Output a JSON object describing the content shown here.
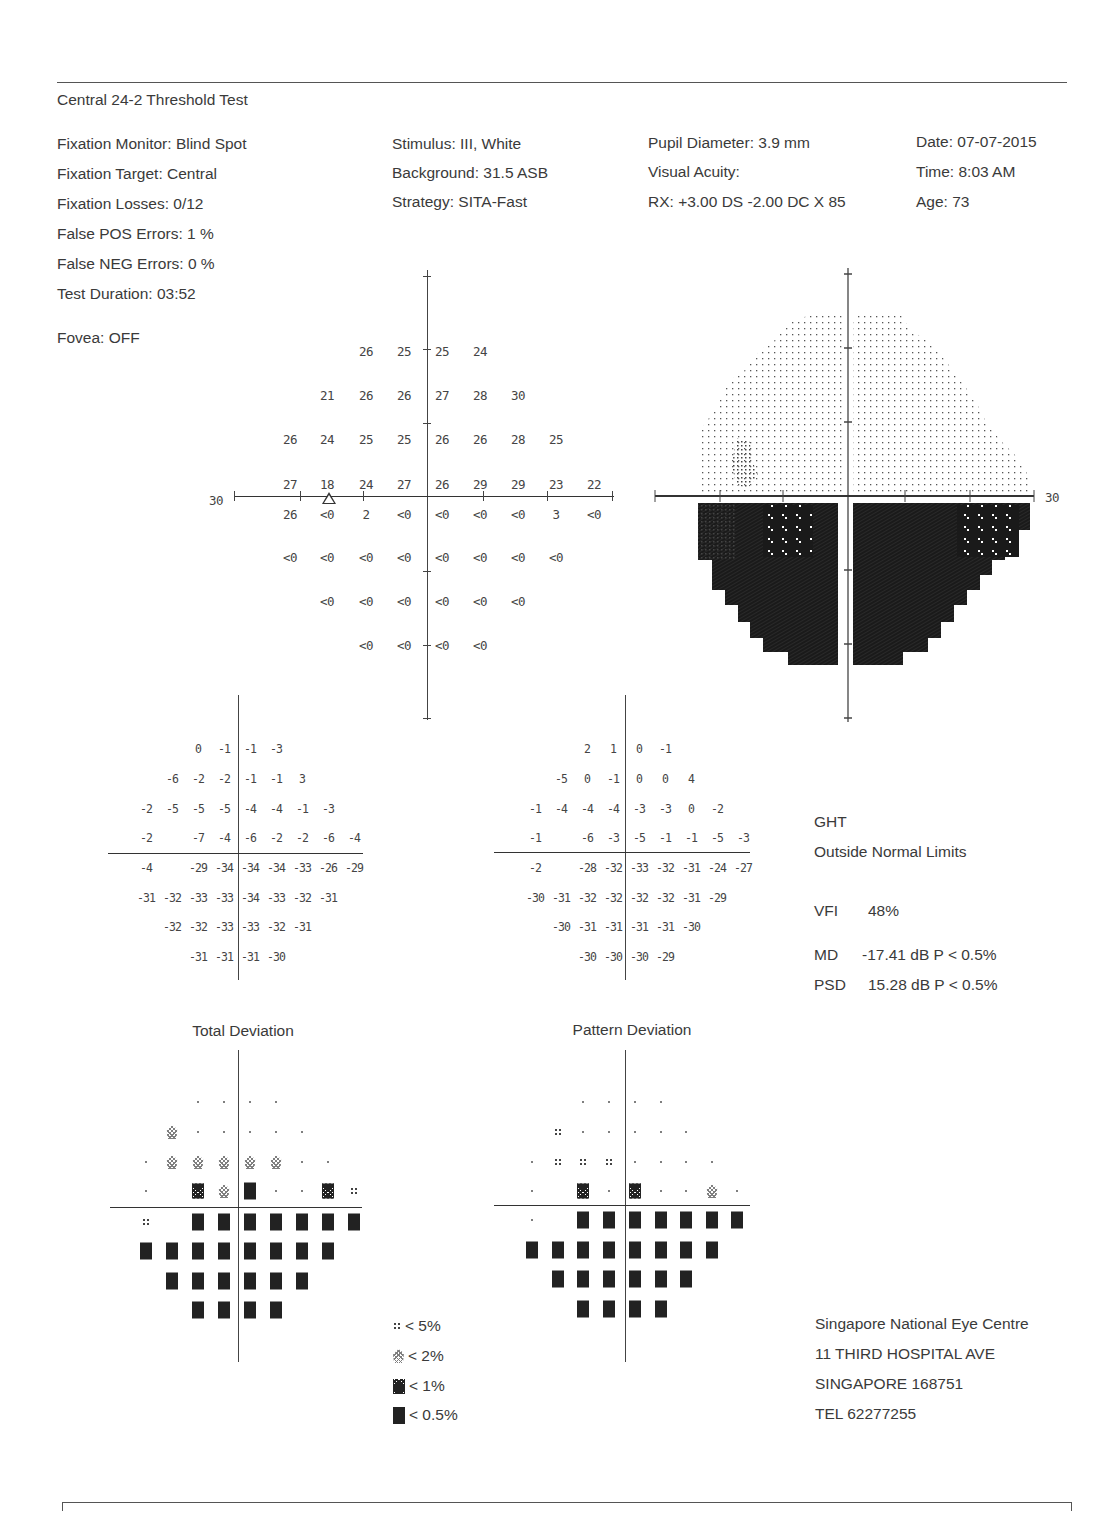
{
  "header": {
    "test_name": "Central 24-2 Threshold Test"
  },
  "info": {
    "col1": [
      "Fixation Monitor: Blind Spot",
      "Fixation Target: Central",
      "Fixation Losses: 0/12",
      "False POS Errors:  1 %",
      "False NEG Errors:  0 %",
      "Test Duration: 03:52"
    ],
    "fovea": "Fovea: OFF",
    "col2": [
      "Stimulus: III, White",
      "Background: 31.5 ASB",
      "Strategy: SITA-Fast"
    ],
    "col3": [
      "Pupil Diameter: 3.9 mm",
      "Visual Acuity:",
      "RX: +3.00 DS  -2.00 DC  X  85"
    ],
    "col4": [
      "Date: 07-07-2015",
      "Time:  8:03 AM",
      "Age: 73"
    ]
  },
  "threshold_plot": {
    "axis_label": "30",
    "rows": [
      {
        "y": 351,
        "cells": [
          [
            366,
            "26"
          ],
          [
            404,
            "25"
          ],
          [
            442,
            "25"
          ],
          [
            480,
            "24"
          ]
        ]
      },
      {
        "y": 395,
        "cells": [
          [
            327,
            "21"
          ],
          [
            366,
            "26"
          ],
          [
            404,
            "26"
          ],
          [
            442,
            "27"
          ],
          [
            480,
            "28"
          ],
          [
            518,
            "30"
          ]
        ]
      },
      {
        "y": 439,
        "cells": [
          [
            290,
            "26"
          ],
          [
            327,
            "24"
          ],
          [
            366,
            "25"
          ],
          [
            404,
            "25"
          ],
          [
            442,
            "26"
          ],
          [
            480,
            "26"
          ],
          [
            518,
            "28"
          ],
          [
            556,
            "25"
          ]
        ]
      },
      {
        "y": 484,
        "cells": [
          [
            290,
            "27"
          ],
          [
            327,
            "18"
          ],
          [
            366,
            "24"
          ],
          [
            404,
            "27"
          ],
          [
            442,
            "26"
          ],
          [
            480,
            "29"
          ],
          [
            518,
            "29"
          ],
          [
            556,
            "23"
          ],
          [
            594,
            "22"
          ]
        ]
      },
      {
        "y": 514,
        "cells": [
          [
            290,
            "26"
          ],
          [
            327,
            "<0"
          ],
          [
            366,
            "2"
          ],
          [
            404,
            "<0"
          ],
          [
            442,
            "<0"
          ],
          [
            480,
            "<0"
          ],
          [
            518,
            "<0"
          ],
          [
            556,
            "3"
          ],
          [
            594,
            "<0"
          ]
        ]
      },
      {
        "y": 557,
        "cells": [
          [
            290,
            "<0"
          ],
          [
            327,
            "<0"
          ],
          [
            366,
            "<0"
          ],
          [
            404,
            "<0"
          ],
          [
            442,
            "<0"
          ],
          [
            480,
            "<0"
          ],
          [
            518,
            "<0"
          ],
          [
            556,
            "<0"
          ]
        ]
      },
      {
        "y": 601,
        "cells": [
          [
            327,
            "<0"
          ],
          [
            366,
            "<0"
          ],
          [
            404,
            "<0"
          ],
          [
            442,
            "<0"
          ],
          [
            480,
            "<0"
          ],
          [
            518,
            "<0"
          ]
        ]
      },
      {
        "y": 645,
        "cells": [
          [
            366,
            "<0"
          ],
          [
            404,
            "<0"
          ],
          [
            442,
            "<0"
          ],
          [
            480,
            "<0"
          ]
        ]
      }
    ]
  },
  "grayscale_plot": {
    "axis_label": "30"
  },
  "total_deviation": {
    "title": "Total Deviation",
    "rows": [
      {
        "y": 749,
        "cells": [
          [
            198,
            "0"
          ],
          [
            224,
            "-1"
          ],
          [
            250,
            "-1"
          ],
          [
            276,
            "-3"
          ]
        ]
      },
      {
        "y": 779,
        "cells": [
          [
            172,
            "-6"
          ],
          [
            198,
            "-2"
          ],
          [
            224,
            "-2"
          ],
          [
            250,
            "-1"
          ],
          [
            276,
            "-1"
          ],
          [
            302,
            "3"
          ]
        ]
      },
      {
        "y": 809,
        "cells": [
          [
            146,
            "-2"
          ],
          [
            172,
            "-5"
          ],
          [
            198,
            "-5"
          ],
          [
            224,
            "-5"
          ],
          [
            250,
            "-4"
          ],
          [
            276,
            "-4"
          ],
          [
            302,
            "-1"
          ],
          [
            328,
            "-3"
          ]
        ]
      },
      {
        "y": 838,
        "cells": [
          [
            146,
            "-2"
          ],
          [
            198,
            "-7"
          ],
          [
            224,
            "-4"
          ],
          [
            250,
            "-6"
          ],
          [
            276,
            "-2"
          ],
          [
            302,
            "-2"
          ],
          [
            328,
            "-6"
          ],
          [
            354,
            "-4"
          ]
        ]
      },
      {
        "y": 868,
        "cells": [
          [
            146,
            "-4"
          ],
          [
            198,
            "-29"
          ],
          [
            224,
            "-34"
          ],
          [
            250,
            "-34"
          ],
          [
            276,
            "-34"
          ],
          [
            302,
            "-33"
          ],
          [
            328,
            "-26"
          ],
          [
            354,
            "-29"
          ]
        ]
      },
      {
        "y": 898,
        "cells": [
          [
            146,
            "-31"
          ],
          [
            172,
            "-32"
          ],
          [
            198,
            "-33"
          ],
          [
            224,
            "-33"
          ],
          [
            250,
            "-34"
          ],
          [
            276,
            "-33"
          ],
          [
            302,
            "-32"
          ],
          [
            328,
            "-31"
          ]
        ]
      },
      {
        "y": 927,
        "cells": [
          [
            172,
            "-32"
          ],
          [
            198,
            "-32"
          ],
          [
            224,
            "-33"
          ],
          [
            250,
            "-33"
          ],
          [
            276,
            "-32"
          ],
          [
            302,
            "-31"
          ]
        ]
      },
      {
        "y": 957,
        "cells": [
          [
            198,
            "-31"
          ],
          [
            224,
            "-31"
          ],
          [
            250,
            "-31"
          ],
          [
            276,
            "-30"
          ]
        ]
      }
    ]
  },
  "pattern_deviation": {
    "title": "Pattern Deviation",
    "rows": [
      {
        "y": 749,
        "cells": [
          [
            587,
            "2"
          ],
          [
            613,
            "1"
          ],
          [
            639,
            "0"
          ],
          [
            665,
            "-1"
          ]
        ]
      },
      {
        "y": 779,
        "cells": [
          [
            561,
            "-5"
          ],
          [
            587,
            "0"
          ],
          [
            613,
            "-1"
          ],
          [
            639,
            "0"
          ],
          [
            665,
            "0"
          ],
          [
            691,
            "4"
          ]
        ]
      },
      {
        "y": 809,
        "cells": [
          [
            535,
            "-1"
          ],
          [
            561,
            "-4"
          ],
          [
            587,
            "-4"
          ],
          [
            613,
            "-4"
          ],
          [
            639,
            "-3"
          ],
          [
            665,
            "-3"
          ],
          [
            691,
            "0"
          ],
          [
            717,
            "-2"
          ]
        ]
      },
      {
        "y": 838,
        "cells": [
          [
            535,
            "-1"
          ],
          [
            587,
            "-6"
          ],
          [
            613,
            "-3"
          ],
          [
            639,
            "-5"
          ],
          [
            665,
            "-1"
          ],
          [
            691,
            "-1"
          ],
          [
            717,
            "-5"
          ],
          [
            743,
            "-3"
          ]
        ]
      },
      {
        "y": 868,
        "cells": [
          [
            535,
            "-2"
          ],
          [
            587,
            "-28"
          ],
          [
            613,
            "-32"
          ],
          [
            639,
            "-33"
          ],
          [
            665,
            "-32"
          ],
          [
            691,
            "-31"
          ],
          [
            717,
            "-24"
          ],
          [
            743,
            "-27"
          ]
        ]
      },
      {
        "y": 898,
        "cells": [
          [
            535,
            "-30"
          ],
          [
            561,
            "-31"
          ],
          [
            587,
            "-32"
          ],
          [
            613,
            "-32"
          ],
          [
            639,
            "-32"
          ],
          [
            665,
            "-32"
          ],
          [
            691,
            "-31"
          ],
          [
            717,
            "-29"
          ]
        ]
      },
      {
        "y": 927,
        "cells": [
          [
            561,
            "-30"
          ],
          [
            587,
            "-31"
          ],
          [
            613,
            "-31"
          ],
          [
            639,
            "-31"
          ],
          [
            665,
            "-31"
          ],
          [
            691,
            "-30"
          ]
        ]
      },
      {
        "y": 957,
        "cells": [
          [
            587,
            "-30"
          ],
          [
            613,
            "-30"
          ],
          [
            639,
            "-30"
          ],
          [
            665,
            "-29"
          ]
        ]
      }
    ]
  },
  "total_deviation_prob": {
    "rows": [
      {
        "y": 1102,
        "cells": [
          [
            198,
            "dot"
          ],
          [
            224,
            "dot"
          ],
          [
            250,
            "dot"
          ],
          [
            276,
            "dot"
          ]
        ]
      },
      {
        "y": 1132,
        "cells": [
          [
            172,
            "p2"
          ],
          [
            198,
            "dot"
          ],
          [
            224,
            "dot"
          ],
          [
            250,
            "dot"
          ],
          [
            276,
            "dot"
          ],
          [
            302,
            "dot"
          ]
        ]
      },
      {
        "y": 1162,
        "cells": [
          [
            146,
            "dot"
          ],
          [
            172,
            "p2"
          ],
          [
            198,
            "p2"
          ],
          [
            224,
            "p2"
          ],
          [
            250,
            "p2"
          ],
          [
            276,
            "p2"
          ],
          [
            302,
            "dot"
          ],
          [
            328,
            "dot"
          ]
        ]
      },
      {
        "y": 1191,
        "cells": [
          [
            146,
            "dot"
          ],
          [
            198,
            "p1"
          ],
          [
            224,
            "p2"
          ],
          [
            250,
            "p05"
          ],
          [
            276,
            "dot"
          ],
          [
            302,
            "dot"
          ],
          [
            328,
            "p1"
          ],
          [
            354,
            "p5"
          ]
        ]
      },
      {
        "y": 1222,
        "cells": [
          [
            146,
            "p5"
          ],
          [
            198,
            "p05"
          ],
          [
            224,
            "p05"
          ],
          [
            250,
            "p05"
          ],
          [
            276,
            "p05"
          ],
          [
            302,
            "p05"
          ],
          [
            328,
            "p05"
          ],
          [
            354,
            "p05"
          ]
        ]
      },
      {
        "y": 1251,
        "cells": [
          [
            146,
            "p05"
          ],
          [
            172,
            "p05"
          ],
          [
            198,
            "p05"
          ],
          [
            224,
            "p05"
          ],
          [
            250,
            "p05"
          ],
          [
            276,
            "p05"
          ],
          [
            302,
            "p05"
          ],
          [
            328,
            "p05"
          ]
        ]
      },
      {
        "y": 1281,
        "cells": [
          [
            172,
            "p05"
          ],
          [
            198,
            "p05"
          ],
          [
            224,
            "p05"
          ],
          [
            250,
            "p05"
          ],
          [
            276,
            "p05"
          ],
          [
            302,
            "p05"
          ]
        ]
      },
      {
        "y": 1310,
        "cells": [
          [
            198,
            "p05"
          ],
          [
            224,
            "p05"
          ],
          [
            250,
            "p05"
          ],
          [
            276,
            "p05"
          ]
        ]
      }
    ]
  },
  "pattern_deviation_prob": {
    "rows": [
      {
        "y": 1102,
        "cells": [
          [
            583,
            "dot"
          ],
          [
            609,
            "dot"
          ],
          [
            635,
            "dot"
          ],
          [
            661,
            "dot"
          ]
        ]
      },
      {
        "y": 1132,
        "cells": [
          [
            558,
            "p5"
          ],
          [
            583,
            "dot"
          ],
          [
            609,
            "dot"
          ],
          [
            635,
            "dot"
          ],
          [
            661,
            "dot"
          ],
          [
            686,
            "dot"
          ]
        ]
      },
      {
        "y": 1162,
        "cells": [
          [
            532,
            "dot"
          ],
          [
            558,
            "p5"
          ],
          [
            583,
            "p5"
          ],
          [
            609,
            "p5"
          ],
          [
            635,
            "dot"
          ],
          [
            661,
            "dot"
          ],
          [
            686,
            "dot"
          ],
          [
            712,
            "dot"
          ]
        ]
      },
      {
        "y": 1191,
        "cells": [
          [
            532,
            "dot"
          ],
          [
            583,
            "p1"
          ],
          [
            609,
            "dot"
          ],
          [
            635,
            "p1"
          ],
          [
            661,
            "dot"
          ],
          [
            686,
            "dot"
          ],
          [
            712,
            "p2"
          ],
          [
            737,
            "dot"
          ]
        ]
      },
      {
        "y": 1220,
        "cells": [
          [
            532,
            "dot"
          ],
          [
            583,
            "p05"
          ],
          [
            609,
            "p05"
          ],
          [
            635,
            "p05"
          ],
          [
            661,
            "p05"
          ],
          [
            686,
            "p05"
          ],
          [
            712,
            "p05"
          ],
          [
            737,
            "p05"
          ]
        ]
      },
      {
        "y": 1250,
        "cells": [
          [
            532,
            "p05"
          ],
          [
            558,
            "p05"
          ],
          [
            583,
            "p05"
          ],
          [
            609,
            "p05"
          ],
          [
            635,
            "p05"
          ],
          [
            661,
            "p05"
          ],
          [
            686,
            "p05"
          ],
          [
            712,
            "p05"
          ]
        ]
      },
      {
        "y": 1279,
        "cells": [
          [
            558,
            "p05"
          ],
          [
            583,
            "p05"
          ],
          [
            609,
            "p05"
          ],
          [
            635,
            "p05"
          ],
          [
            661,
            "p05"
          ],
          [
            686,
            "p05"
          ]
        ]
      },
      {
        "y": 1309,
        "cells": [
          [
            583,
            "p05"
          ],
          [
            609,
            "p05"
          ],
          [
            635,
            "p05"
          ],
          [
            661,
            "p05"
          ]
        ]
      }
    ]
  },
  "global_indices": {
    "ght_label": "GHT",
    "ght_result": "Outside Normal Limits",
    "vfi_label": "VFI",
    "vfi_value": "48%",
    "md_label": "MD",
    "md_value": "-17.41 dB  P < 0.5%",
    "psd_label": "PSD",
    "psd_value": "15.28 dB  P < 0.5%"
  },
  "legend": [
    {
      "symbol": "p5",
      "label": "< 5%"
    },
    {
      "symbol": "p2",
      "label": "< 2%"
    },
    {
      "symbol": "p1",
      "label": "< 1%"
    },
    {
      "symbol": "p05",
      "label": "< 0.5%"
    }
  ],
  "institution": {
    "name": "Singapore National Eye Centre",
    "address1": "11 THIRD HOSPITAL AVE",
    "address2": "SINGAPORE 168751",
    "tel": "TEL 62277255"
  }
}
